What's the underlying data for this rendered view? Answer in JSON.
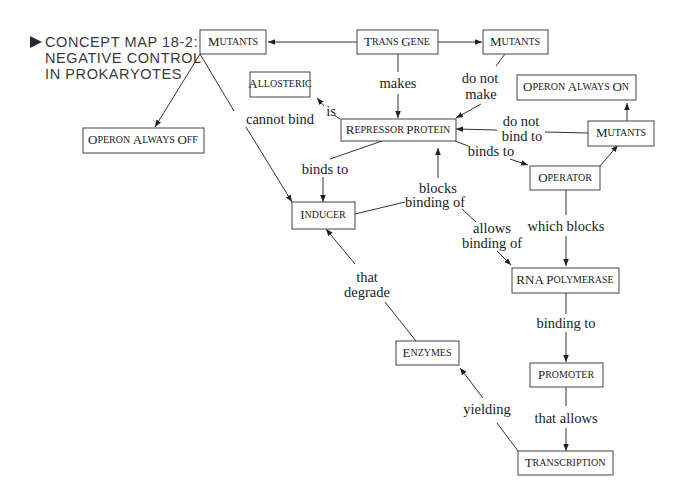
{
  "title": {
    "lines": [
      "CONCEPT MAP 18-2:",
      "NEGATIVE CONTROL",
      "IN PROKARYOTES"
    ],
    "marker": "▶"
  },
  "nodes": {
    "mutants_left": {
      "big": "M",
      "small": "UTANTS"
    },
    "trans_gene": {
      "big1": "T",
      "small1": "RANS ",
      "big2": "G",
      "small2": "ENE"
    },
    "mutants_top_right": {
      "big": "M",
      "small": "UTANTS"
    },
    "allosteric": {
      "big": "A",
      "small": "LLOSTERIC"
    },
    "operon_always_on": {
      "big1": "O",
      "small1": "PERON ",
      "big2": "A",
      "small2": "LWAYS ",
      "big3": "O",
      "small3": "N"
    },
    "operon_always_off": {
      "big1": "O",
      "small1": "PERON ",
      "big2": "A",
      "small2": "LWAYS ",
      "big3": "O",
      "small3": "FF"
    },
    "repressor_protein": {
      "big1": "R",
      "small1": "EPRESSOR ",
      "big2": "P",
      "small2": "ROTEIN"
    },
    "mutants_right": {
      "big": "M",
      "small": "UTANTS"
    },
    "operator": {
      "big": "O",
      "small": "PERATOR"
    },
    "inducer": {
      "big": "I",
      "small": "NDUCER"
    },
    "rna_polymerase": {
      "big1": "RNA ",
      "big2": "P",
      "small2": "OLYMERASE"
    },
    "promoter": {
      "big": "P",
      "small": "ROMOTER"
    },
    "enzymes": {
      "big": "E",
      "small": "NZYMES"
    },
    "transcription": {
      "big": "T",
      "small": "RANSCRIPTION"
    }
  },
  "edge_labels": {
    "makes": "makes",
    "do_not_make_1": "do not",
    "do_not_make_2": "make",
    "is": "is",
    "cannot_bind": "cannot bind",
    "do_not_bind_1": "do not",
    "do_not_bind_2": "bind to",
    "binds_to_operator": "binds to",
    "binds_to_inducer": "binds to",
    "blocks_binding_1": "blocks",
    "blocks_binding_2": "binding of",
    "allows_binding_1": "allows",
    "allows_binding_2": "binding of",
    "which_blocks": "which blocks",
    "binding_to": "binding to",
    "that_degrade_1": "that",
    "that_degrade_2": "degrade",
    "that_allows": "that allows",
    "yielding": "yielding"
  }
}
